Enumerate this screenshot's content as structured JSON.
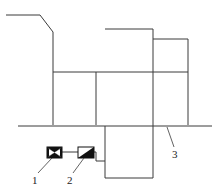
{
  "diagram": {
    "type": "schematic",
    "colors": {
      "line": "#3a3a3a",
      "fill": "#111111",
      "background": "#ffffff"
    },
    "labels": [
      {
        "id": "1",
        "text": "1",
        "refers_to": "valve-symbol"
      },
      {
        "id": "2",
        "text": "2",
        "refers_to": "actuator-symbol"
      },
      {
        "id": "3",
        "text": "3",
        "refers_to": "baseline"
      }
    ]
  }
}
